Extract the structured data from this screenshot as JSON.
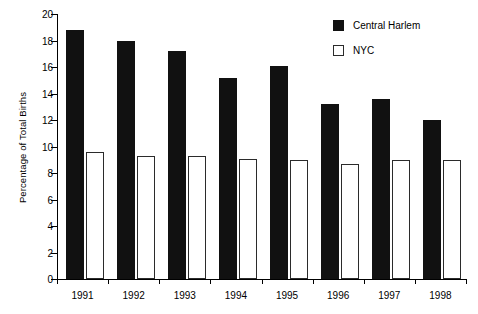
{
  "chart_data": {
    "type": "bar",
    "title": "",
    "xlabel": "",
    "ylabel": "Percentage of Total Births",
    "categories": [
      "1991",
      "1992",
      "1993",
      "1994",
      "1995",
      "1996",
      "1997",
      "1998"
    ],
    "series": [
      {
        "name": "Central Harlem",
        "color": "#111111",
        "style": "filled",
        "values": [
          18.8,
          18.0,
          17.2,
          15.2,
          16.1,
          13.2,
          13.6,
          12.0
        ]
      },
      {
        "name": "NYC",
        "color": "#ffffff",
        "style": "hollow",
        "values": [
          9.6,
          9.25,
          9.3,
          9.05,
          9.0,
          8.7,
          9.0,
          9.0
        ]
      }
    ],
    "ylim": [
      0,
      20
    ],
    "yticks": [
      0,
      2,
      4,
      6,
      8,
      10,
      12,
      14,
      16,
      18,
      20
    ],
    "ytick_labels": [
      "0",
      "2",
      "4",
      "6",
      "8",
      "10",
      "12",
      "14",
      "16",
      "18",
      "20"
    ],
    "grid": false,
    "legend_position": "top-right"
  },
  "legend": {
    "items": [
      {
        "label": "Central Harlem",
        "swatch": "filled-square-icon"
      },
      {
        "label": "NYC",
        "swatch": "hollow-square-icon"
      }
    ]
  }
}
